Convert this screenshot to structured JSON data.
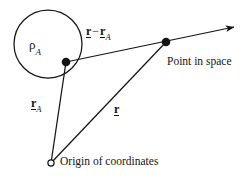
{
  "figure": {
    "width": 244,
    "height": 180,
    "background_color": "#ffffff",
    "stroke_color": "#141414"
  },
  "labels": {
    "charge_density": {
      "symbol": "ρ",
      "subscript": "A"
    },
    "vector_difference": {
      "symbol": "r",
      "operator": "−",
      "symbol2": "r",
      "subscript2": "A"
    },
    "vector_ra": {
      "symbol": "r",
      "subscript": "A"
    },
    "vector_r": {
      "symbol": "r"
    },
    "point_in_space": "Point in space",
    "origin_of_coordinates": "Origin of coordinates"
  },
  "geometry": {
    "circle": {
      "cx": 48,
      "cy": 44,
      "r": 34
    },
    "source_point": {
      "x": 66,
      "y": 62
    },
    "field_point": {
      "x": 166,
      "y": 42
    },
    "origin_point": {
      "x": 51,
      "y": 163
    },
    "arrow_tip": {
      "x": 238,
      "y": 26
    }
  }
}
